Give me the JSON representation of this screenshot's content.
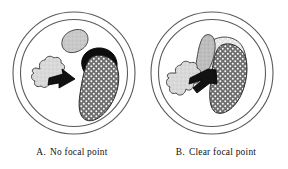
{
  "figure": {
    "type": "two-panel-illustration",
    "background_color": "#ffffff",
    "panels": [
      {
        "id": "A",
        "label_letter": "A.",
        "caption": "No focal point",
        "description": "Circular frame containing three scattered organic shapes with no single dominant element",
        "frame": {
          "shape": "double-ring-circle",
          "center_x": 74,
          "center_y": 73,
          "outer_radius": 61,
          "inner_radius": 54,
          "stroke_color": "#555555"
        },
        "shapes": [
          {
            "name": "small-leaf-shape",
            "fill": "#c9c9c9",
            "texture": "speckled",
            "stroke": "#4a4a4a"
          },
          {
            "name": "cloud-cluster-shape",
            "fill": "#d5d5d5",
            "texture": "speckled",
            "stroke": "#4a4a4a"
          },
          {
            "name": "arrow-shape",
            "fill": "#111111",
            "texture": "solid",
            "stroke": "#000000"
          },
          {
            "name": "black-blob-shape",
            "fill": "#0d0d0d",
            "texture": "solid",
            "stroke": "#000000"
          },
          {
            "name": "dotted-kidney-shape",
            "fill": "#6e6e6e",
            "texture": "white-dots",
            "stroke": "#2a2a2a"
          }
        ]
      },
      {
        "id": "B",
        "label_letter": "B.",
        "caption": "Clear focal point",
        "description": "Circular frame containing overlapping organic shapes converging on one dominant dotted form",
        "frame": {
          "shape": "double-ring-circle",
          "center_x": 212,
          "center_y": 73,
          "outer_radius": 61,
          "inner_radius": 54,
          "stroke_color": "#555555"
        },
        "shapes": [
          {
            "name": "small-leaf-shape",
            "fill": "#bdbdbd",
            "texture": "speckled",
            "stroke": "#4a4a4a"
          },
          {
            "name": "pale-dotted-backdrop-shape",
            "fill": "#e2e2e2",
            "texture": "light-dots",
            "stroke": "#4a4a4a"
          },
          {
            "name": "cloud-cluster-shape",
            "fill": "#d5d5d5",
            "texture": "speckled",
            "stroke": "#4a4a4a"
          },
          {
            "name": "arrow-shape",
            "fill": "#111111",
            "texture": "solid",
            "stroke": "#000000"
          },
          {
            "name": "dotted-kidney-shape",
            "fill": "#6e6e6e",
            "texture": "white-dots",
            "stroke": "#2a2a2a"
          }
        ]
      }
    ]
  },
  "colors": {
    "page_background": "#ffffff",
    "frame_stroke": "#555555",
    "outline_stroke": "#3c3c3c",
    "black_fill": "#0d0d0d",
    "dark_dotted_fill": "#6e6e6e",
    "mid_gray_fill": "#c9c9c9",
    "light_gray_fill": "#d8d8d8",
    "pale_fill": "#e4e4e4",
    "caption_text": "#111111"
  }
}
